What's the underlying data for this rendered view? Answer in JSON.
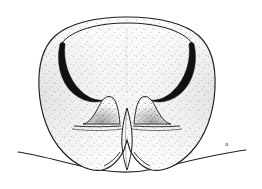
{
  "figure": {
    "kind": "scientific-line-drawing",
    "subject_description": "Ventral view of an insect terminal abdominal segment: broad bilobed plate with stippled shading, two thick black crescent-shaped hooks in the upper third, two bell-shaped median mounds, a narrow median cleft, and a wavy background baseline",
    "panel_label": "a",
    "label_position": {
      "x": 225,
      "y": 141
    },
    "colors": {
      "background": "#ffffff",
      "outline": "#1a1a1a",
      "hook_fill": "#111111",
      "stipple": "#4a4a4a",
      "baseline": "#222222",
      "label_text": "#2b2b2b"
    },
    "geometry": {
      "body_bbox": {
        "x": 40,
        "y": 17,
        "width": 175,
        "height": 155
      },
      "baseline_span": {
        "x_start": 18,
        "x_end": 246,
        "y_mid": 158
      },
      "median_cleft": {
        "x": 127,
        "y_top": 108,
        "y_bottom": 170
      },
      "left_hook": {
        "x": 58,
        "y": 48
      },
      "right_hook": {
        "x": 196,
        "y": 48
      },
      "left_mound": {
        "x": 103,
        "y": 112
      },
      "right_mound": {
        "x": 152,
        "y": 112
      }
    },
    "stipple": {
      "interior_density": "sparse",
      "edge_density": "dense",
      "dot_radius_px": 0.45
    }
  }
}
